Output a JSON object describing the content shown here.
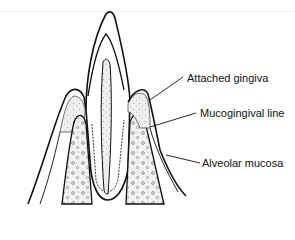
{
  "figure": {
    "labels": [
      {
        "id": "attached-gingiva",
        "text": "Attached gingiva"
      },
      {
        "id": "mucogingival-line",
        "text": "Mucogingival line"
      },
      {
        "id": "alveolar-mucosa",
        "text": "Alveolar mucosa"
      }
    ],
    "colors": {
      "line": "#111111",
      "stipple": "#cfcfcf",
      "background": "#ffffff"
    }
  }
}
